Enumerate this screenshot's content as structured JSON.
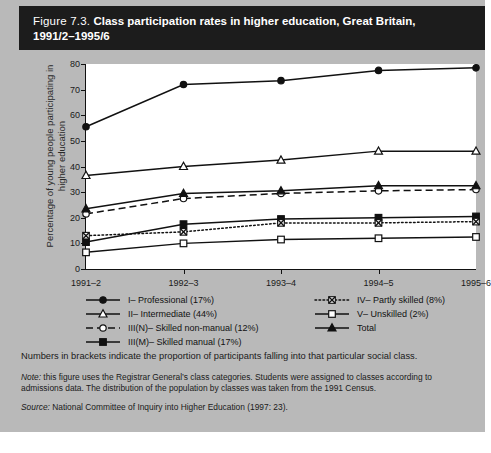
{
  "figure": {
    "number": "Figure 7.3.",
    "title_line1": "Class participation rates in higher education, Great Britain,",
    "title_line2": "1991/2–1995/6"
  },
  "notes": {
    "brackets": "Numbers in brackets indicate the proportion of participants falling into that particular social class.",
    "note_label": "Note:",
    "note_text": " this figure uses the Registrar General’s class categories. Students were assigned to classes according to admissions data. The distribution of the population by classes was taken from the 1991 Census.",
    "source_label": "Source:",
    "source_text": " National Committee of Inquiry into Higher Education (1997: 23)."
  },
  "chart_data": {
    "type": "line",
    "title": "Class participation rates in higher education, Great Britain, 1991/2–1995/6",
    "xlabel": "",
    "ylabel": "Percentage of young people participating in higher education",
    "categories": [
      "1991–2",
      "1992–3",
      "1993–4",
      "1994–5",
      "1995–6"
    ],
    "ylim": [
      0,
      80
    ],
    "yticks": [
      0,
      10,
      20,
      30,
      40,
      50,
      60,
      70,
      80
    ],
    "grid": false,
    "legend_position": "below",
    "series": [
      {
        "name": "I– Professional (17%)",
        "key": "professional",
        "marker": "filled-circle",
        "line": "solid",
        "color": "#111111",
        "values": [
          55.5,
          72.0,
          73.5,
          77.5,
          78.5
        ]
      },
      {
        "name": "II– Intermediate (44%)",
        "key": "intermediate",
        "marker": "open-triangle",
        "line": "solid",
        "color": "#111111",
        "values": [
          36.5,
          40.0,
          42.5,
          46.0,
          46.0
        ]
      },
      {
        "name": "III(N)– Skilled non-manual (12%)",
        "key": "skilled-non-manual",
        "marker": "open-circle",
        "line": "dashed",
        "color": "#111111",
        "values": [
          21.5,
          27.5,
          29.5,
          30.5,
          31.0
        ]
      },
      {
        "name": "III(M)– Skilled manual (17%)",
        "key": "skilled-manual",
        "marker": "filled-square",
        "line": "solid",
        "color": "#111111",
        "values": [
          10.5,
          17.5,
          19.5,
          20.0,
          20.5
        ]
      },
      {
        "name": "IV– Partly skilled (8%)",
        "key": "partly-skilled",
        "marker": "cross-box",
        "line": "dotted",
        "color": "#111111",
        "values": [
          13.0,
          14.5,
          18.0,
          18.0,
          18.5
        ]
      },
      {
        "name": "V– Unskilled (2%)",
        "key": "unskilled",
        "marker": "open-square",
        "line": "solid",
        "color": "#111111",
        "values": [
          6.5,
          10.0,
          11.5,
          12.0,
          12.5
        ]
      },
      {
        "name": "Total",
        "key": "total",
        "marker": "filled-triangle",
        "line": "solid",
        "color": "#111111",
        "values": [
          23.5,
          29.5,
          30.5,
          32.5,
          32.5
        ]
      }
    ]
  }
}
